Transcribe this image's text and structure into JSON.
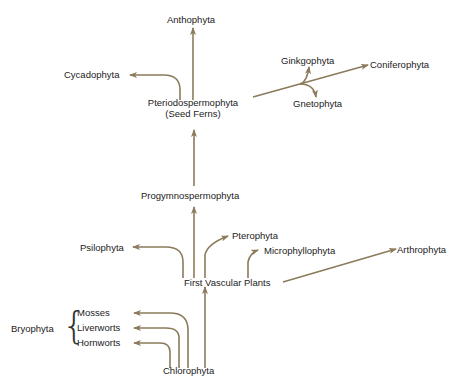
{
  "diagram": {
    "type": "phylogenetic-tree",
    "arrow_color": "#8B7B5C",
    "nodes": {
      "anthophyta": "Anthophyta",
      "cycadophyta": "Cycadophyta",
      "pteriodospermophyta": "Pteriodospermophyta",
      "seed_ferns": "(Seed Ferns)",
      "ginkgophyta": "Ginkgophyta",
      "coniferophyta": "Coniferophyta",
      "gnetophyta": "Gnetophyta",
      "progymnospermophyta": "Progymnospermophyta",
      "psilophyta": "Psilophyta",
      "pterophyta": "Pterophyta",
      "microphyllophyta": "Microphyllophyta",
      "arthrophyta": "Arthrophyta",
      "first_vascular_plants": "First Vascular Plants",
      "bryophyta": "Bryophyta",
      "mosses": "Mosses",
      "liverworts": "Liverworts",
      "hornworts": "Hornworts",
      "chlorophyta": "Chlorophyta"
    },
    "edges": [
      {
        "from": "Chlorophyta",
        "to": "First Vascular Plants"
      },
      {
        "from": "Chlorophyta",
        "to": "Mosses"
      },
      {
        "from": "Chlorophyta",
        "to": "Liverworts"
      },
      {
        "from": "Chlorophyta",
        "to": "Hornworts"
      },
      {
        "from": "First Vascular Plants",
        "to": "Psilophyta"
      },
      {
        "from": "First Vascular Plants",
        "to": "Progymnospermophyta"
      },
      {
        "from": "First Vascular Plants",
        "to": "Pterophyta"
      },
      {
        "from": "First Vascular Plants",
        "to": "Microphyllophyta"
      },
      {
        "from": "First Vascular Plants",
        "to": "Arthrophyta"
      },
      {
        "from": "Progymnospermophyta",
        "to": "Pteriodospermophyta (Seed Ferns)"
      },
      {
        "from": "Pteriodospermophyta (Seed Ferns)",
        "to": "Anthophyta"
      },
      {
        "from": "Pteriodospermophyta (Seed Ferns)",
        "to": "Cycadophyta"
      },
      {
        "from": "Pteriodospermophyta (Seed Ferns)",
        "to": "Coniferophyta"
      },
      {
        "from": "Pteriodospermophyta (Seed Ferns)",
        "to": "Ginkgophyta"
      },
      {
        "from": "Pteriodospermophyta (Seed Ferns)",
        "to": "Gnetophyta"
      }
    ]
  }
}
